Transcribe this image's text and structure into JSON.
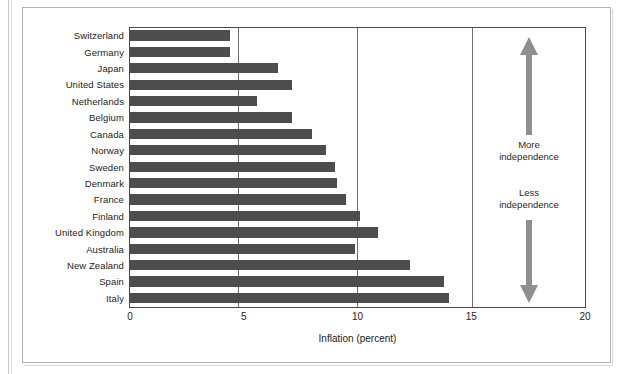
{
  "chart_data": {
    "type": "bar",
    "orientation": "horizontal",
    "title": "",
    "subtitle": "",
    "xlabel": "Inflation (percent)",
    "ylabel": "",
    "xlim": [
      0,
      20
    ],
    "xticks": [
      0,
      5,
      10,
      15,
      20
    ],
    "xtick_labels": [
      "0",
      "5",
      "10",
      "15",
      "20"
    ],
    "grid": "vertical gridlines at 5, 10, 15",
    "legend": "none",
    "bar_color": "#4d4d4d",
    "categories": [
      "Switzerland",
      "Germany",
      "Japan",
      "United States",
      "Netherlands",
      "Belgium",
      "Canada",
      "Norway",
      "Sweden",
      "Denmark",
      "France",
      "Finland",
      "United Kingdom",
      "Australia",
      "New Zealand",
      "Spain",
      "Italy"
    ],
    "values": [
      4.4,
      4.4,
      6.5,
      7.1,
      5.6,
      7.1,
      8.0,
      8.6,
      9.0,
      9.1,
      9.5,
      10.1,
      10.9,
      9.9,
      12.3,
      13.8,
      14.0
    ],
    "annotations": [
      {
        "text": "More independence",
        "line1": "More",
        "line2": "independence",
        "arrow": "up"
      },
      {
        "text": "Less independence",
        "line1": "Less",
        "line2": "independence",
        "arrow": "down"
      }
    ],
    "annotation_arrow_color": "#8a8a8a"
  },
  "axis": {
    "x_title": "Inflation (percent)",
    "tick_0": "0",
    "tick_5": "5",
    "tick_10": "10",
    "tick_15": "15",
    "tick_20": "20"
  },
  "annotation": {
    "more_line1": "More",
    "more_line2": "independence",
    "less_line1": "Less",
    "less_line2": "independence"
  }
}
